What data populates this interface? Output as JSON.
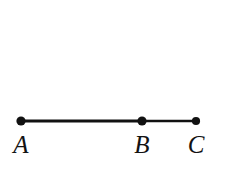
{
  "figure": {
    "type": "line-segment-diagram",
    "background_color": "#ffffff",
    "stroke_color": "#111111",
    "label_color": "#131313",
    "width": 225,
    "height": 185,
    "line": {
      "y": 121,
      "x_start": 21,
      "x_end": 196,
      "thickness": 3
    },
    "points": [
      {
        "id": "A",
        "label": "A",
        "x": 21,
        "y": 121,
        "dot_radius": 4.6,
        "label_x": 21,
        "label_y": 132
      },
      {
        "id": "B",
        "label": "B",
        "x": 142,
        "y": 121,
        "dot_radius": 4.6,
        "label_x": 142,
        "label_y": 132
      },
      {
        "id": "C",
        "label": "C",
        "x": 196,
        "y": 121,
        "dot_radius": 4.1,
        "label_x": 196,
        "label_y": 132
      }
    ],
    "segments": [
      {
        "id": "AB",
        "from": "A",
        "to": "B",
        "thickness": 3
      },
      {
        "id": "BC",
        "from": "B",
        "to": "C",
        "thickness": 2.6
      }
    ]
  }
}
